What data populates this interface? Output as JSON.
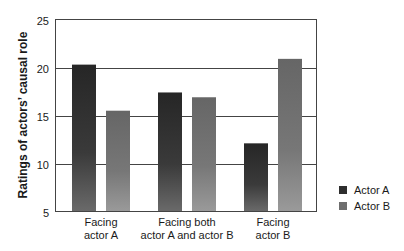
{
  "chart_data": {
    "type": "bar",
    "title": "",
    "xlabel": "",
    "ylabel": "Ratings of actors’ causal role",
    "ylim": [
      5,
      25
    ],
    "yticks": [
      5,
      10,
      15,
      20,
      25
    ],
    "grid": true,
    "legend_position": "right-bottom",
    "categories": [
      "Facing actor A",
      "Facing both actor A and actor B",
      "Facing actor B"
    ],
    "category_lines": [
      [
        "Facing",
        "actor A"
      ],
      [
        "Facing both",
        "actor A and actor B"
      ],
      [
        "Facing",
        "actor B"
      ]
    ],
    "series": [
      {
        "name": "Actor A",
        "color": "#2e2e2e",
        "values": [
          20.3,
          17.4,
          12.1
        ]
      },
      {
        "name": "Actor B",
        "color": "#6e6e6e",
        "values": [
          15.5,
          16.9,
          20.9
        ]
      }
    ]
  },
  "legend": {
    "items": [
      {
        "label": "Actor A",
        "color": "#2e2e2e"
      },
      {
        "label": "Actor B",
        "color": "#6e6e6e"
      }
    ]
  }
}
